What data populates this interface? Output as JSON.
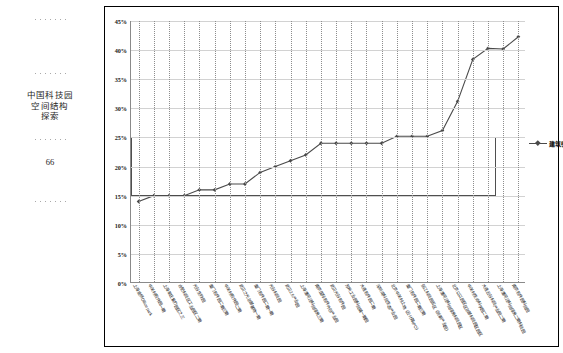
{
  "margin": {
    "running_head": "中国科技园\n空间结构\n探索",
    "running_head_lines": [
      "中国科技园",
      "空间结构",
      "探索"
    ],
    "page_number": "66"
  },
  "legend": {
    "label": "建筑密度",
    "marker": "line-diamond-marker"
  },
  "chart_data": {
    "type": "line",
    "title": "",
    "xlabel": "",
    "ylabel": "",
    "ylim": [
      0,
      0.45
    ],
    "ytick_labels": [
      "45%",
      "40%",
      "35%",
      "30%",
      "25%",
      "20%",
      "15%",
      "10%",
      "5%",
      "0%"
    ],
    "ytick_values": [
      45,
      40,
      35,
      30,
      25,
      20,
      15,
      10,
      5,
      0
    ],
    "grid": {
      "horizontal": true,
      "vertical": "dotted"
    },
    "legend_position": "right",
    "series": [
      {
        "name": "建筑密度",
        "color": "#4a4a4a",
        "marker": "diamond",
        "values": [
          14.0,
          15.0,
          15.0,
          15.0,
          16.0,
          16.0,
          17.0,
          17.0,
          19.0,
          20.0,
          21.0,
          22.0,
          24.0,
          24.0,
          24.0,
          24.0,
          24.0,
          25.2,
          25.2,
          25.2,
          26.2,
          31.2,
          38.4,
          40.3,
          40.2,
          42.3
        ]
      }
    ],
    "categories": [
      "上海金桥Office park",
      "中关村软件园一期",
      "上海莘庄紫竹园区之三",
      "合肥科技区工业园区二期",
      "光谷生物园",
      "厦门软件园二期三期",
      "中关村软件园二期",
      "武汉之光总部基地一期",
      "厦门软件园二期一期",
      "光谷科技园",
      "武汉2.5产业园",
      "上海漕河泾科技绿洲三期",
      "南京国际软件外包产业园",
      "武汉光谷软件园",
      "苏州工业园科技城一期园",
      "大连软件园二期",
      "深圳湾科技生态产业园",
      "北京中关村上地（云计算IPO）",
      "厦门软件园二期三期",
      "张江科技园五区（创新产业园）",
      "上海漕河泾科技绿洲科技园区",
      "北京以以园区区总部科技园区园区",
      "中关村生命科学园二期",
      "大连云谷科技产业园二期",
      "上海漕河泾科技绿洲二期科技园",
      "南京软件园科技园"
    ],
    "highlight_box": {
      "y_min": 15,
      "y_max": 25,
      "x_start_index": 0,
      "x_end_index": 23,
      "stroke": "#4f4f4f"
    }
  }
}
